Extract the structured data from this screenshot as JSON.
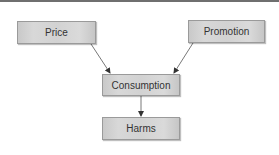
{
  "diagram": {
    "nodes": [
      {
        "id": "price",
        "label": "Price"
      },
      {
        "id": "promotion",
        "label": "Promotion"
      },
      {
        "id": "consumption",
        "label": "Consumption"
      },
      {
        "id": "harms",
        "label": "Harms"
      }
    ],
    "edges": [
      {
        "from": "price",
        "to": "consumption"
      },
      {
        "from": "promotion",
        "to": "consumption"
      },
      {
        "from": "consumption",
        "to": "harms"
      }
    ],
    "colors": {
      "box_fill": "#d4d4d4",
      "box_border": "#9a9a9a",
      "arrow": "#333333",
      "text": "#333333"
    }
  }
}
